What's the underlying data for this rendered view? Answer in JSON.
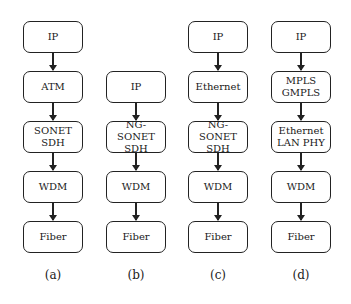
{
  "diagram": {
    "columns": [
      {
        "id": "a",
        "label": "(a)",
        "x": 23,
        "boxes": [
          {
            "text": "IP",
            "y": 21
          },
          {
            "text": "ATM",
            "y": 71
          },
          {
            "text": "SONET\nSDH",
            "y": 121
          },
          {
            "text": "WDM",
            "y": 171
          },
          {
            "text": "Fiber",
            "y": 221
          }
        ]
      },
      {
        "id": "b",
        "label": "(b)",
        "x": 106,
        "boxes": [
          {
            "text": "IP",
            "y": 71
          },
          {
            "text": "NG-SONET\nSDH",
            "y": 121
          },
          {
            "text": "WDM",
            "y": 171
          },
          {
            "text": "Fiber",
            "y": 221
          }
        ]
      },
      {
        "id": "c",
        "label": "(c)",
        "x": 188,
        "boxes": [
          {
            "text": "IP",
            "y": 21
          },
          {
            "text": "Ethernet",
            "y": 71
          },
          {
            "text": "NG-SONET\nSDH",
            "y": 121
          },
          {
            "text": "WDM",
            "y": 171
          },
          {
            "text": "Fiber",
            "y": 221
          }
        ]
      },
      {
        "id": "d",
        "label": "(d)",
        "x": 271,
        "boxes": [
          {
            "text": "IP",
            "y": 21
          },
          {
            "text": "MPLS\nGMPLS",
            "y": 71
          },
          {
            "text": "Ethernet\nLAN PHY",
            "y": 121
          },
          {
            "text": "WDM",
            "y": 171
          },
          {
            "text": "Fiber",
            "y": 221
          }
        ]
      }
    ],
    "caption_y": 268
  }
}
